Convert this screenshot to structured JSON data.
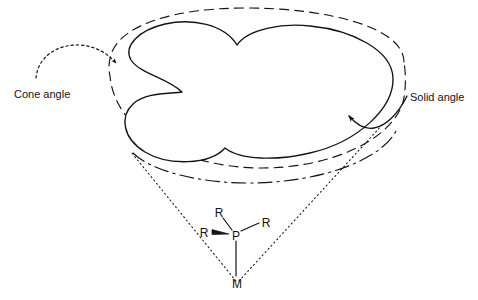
{
  "figure": {
    "type": "diagram",
    "background_color": "#ffffff",
    "ink_color": "#141414"
  },
  "annotations": {
    "cone_angle": {
      "label": "Cone angle",
      "leader_style": "dotted-arc-arrow",
      "points_to": "dashed cone base ellipse (left edge)"
    },
    "solid_angle": {
      "label": "Solid angle",
      "leader_style": "solid-curved-arrow",
      "points_to": "cloud-shaped solid angle projection (right edge)"
    }
  },
  "molecule": {
    "center_atom": {
      "label": "P",
      "x": 235,
      "y": 236
    },
    "metal_atom": {
      "label": "M",
      "x": 237,
      "y": 283
    },
    "substituents": [
      {
        "label": "R",
        "x": 219,
        "y": 213,
        "bond": "plain"
      },
      {
        "label": "R",
        "x": 203,
        "y": 233,
        "bond": "wedge"
      },
      {
        "label": "R",
        "x": 266,
        "y": 223,
        "bond": "plain"
      }
    ],
    "bonds": [
      {
        "from": "P",
        "to": "M",
        "style": "plain"
      },
      {
        "from": "P",
        "to": "R-top",
        "style": "plain"
      },
      {
        "from": "P",
        "to": "R-left",
        "style": "wedge"
      },
      {
        "from": "P",
        "to": "R-right",
        "style": "plain"
      }
    ]
  },
  "shapes": {
    "solid_angle_cloud": {
      "name": "solid-angle-cloud",
      "style": "solid",
      "description": "irregular multi-lobed closed outline representing the ligand solid angle projection"
    },
    "cone_base_ellipse": {
      "name": "cone-base-ellipse",
      "style": "dashed",
      "description": "ellipse representing the circular base of the Tolman cone"
    },
    "cone_base_ellipse_inner": {
      "name": "cone-base-ellipse-inner",
      "style": "dash-dot",
      "description": "lower dash-dot arc of the cone base ellipse"
    },
    "cone_side_lines": {
      "name": "cone-side-lines",
      "style": "dotted",
      "count": 2,
      "description": "dotted generator lines from M to the cone base rim"
    }
  }
}
